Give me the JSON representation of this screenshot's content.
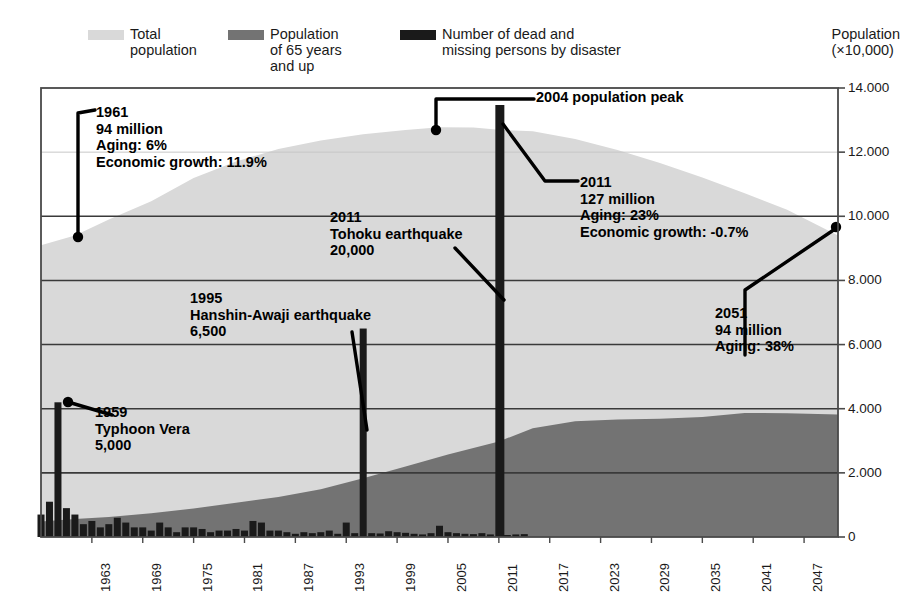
{
  "legend": {
    "items": [
      {
        "name": "total-population",
        "label": "Total\npopulation",
        "color": "#d9d9d9"
      },
      {
        "name": "elderly-population",
        "label": "Population\nof 65 years\nand up",
        "color": "#737373"
      },
      {
        "name": "disaster-deaths",
        "label": "Number of dead and\nmissing persons by disaster",
        "color": "#1a1a1a"
      }
    ]
  },
  "axis_title": "Population\n(×10,000)",
  "chart_data": {
    "type": "area",
    "title": "",
    "subtitle": "",
    "xlabel": "",
    "ylabel": "Population (×10,000)",
    "ylim": [
      0,
      14000
    ],
    "xlim": [
      1957,
      2051
    ],
    "grid": true,
    "legend_position": "top",
    "y_ticks": [
      "0",
      "2.000",
      "4.000",
      "6.000",
      "8.000",
      "10.000",
      "12.000",
      "14.000"
    ],
    "y_tick_values": [
      0,
      2000,
      4000,
      6000,
      8000,
      10000,
      12000,
      14000
    ],
    "x_ticks": [
      "1963",
      "1969",
      "1975",
      "1981",
      "1987",
      "1993",
      "1999",
      "2005",
      "2011",
      "2017",
      "2023",
      "2029",
      "2035",
      "2041",
      "2047"
    ],
    "x_tick_values": [
      1963,
      1969,
      1975,
      1981,
      1987,
      1993,
      1999,
      2005,
      2011,
      2017,
      2023,
      2029,
      2035,
      2041,
      2047
    ],
    "series": [
      {
        "name": "Total population",
        "type": "area",
        "color": "#d9d9d9",
        "x": [
          1957,
          1961,
          1965,
          1970,
          1975,
          1980,
          1985,
          1990,
          1995,
          2000,
          2004,
          2008,
          2011,
          2015,
          2020,
          2025,
          2030,
          2035,
          2040,
          2045,
          2051
        ],
        "values": [
          9100,
          9400,
          9900,
          10470,
          11190,
          11710,
          12100,
          12360,
          12560,
          12690,
          12780,
          12770,
          12700,
          12650,
          12410,
          12070,
          11660,
          11210,
          10720,
          10200,
          9400
        ]
      },
      {
        "name": "Population of 65 years and up",
        "type": "area",
        "color": "#737373",
        "x": [
          1957,
          1961,
          1965,
          1970,
          1975,
          1980,
          1985,
          1990,
          1995,
          2000,
          2005,
          2011,
          2015,
          2020,
          2025,
          2030,
          2035,
          2040,
          2045,
          2051
        ],
        "values": [
          480,
          560,
          620,
          740,
          890,
          1070,
          1250,
          1490,
          1830,
          2200,
          2570,
          2980,
          3390,
          3610,
          3660,
          3690,
          3740,
          3870,
          3860,
          3820
        ]
      },
      {
        "name": "Number of dead and missing persons by disaster",
        "type": "bar",
        "color": "#1a1a1a",
        "x": [
          1957,
          1958,
          1959,
          1960,
          1961,
          1962,
          1963,
          1964,
          1965,
          1966,
          1967,
          1968,
          1969,
          1970,
          1971,
          1972,
          1973,
          1974,
          1975,
          1976,
          1977,
          1978,
          1979,
          1980,
          1981,
          1982,
          1983,
          1984,
          1985,
          1986,
          1987,
          1988,
          1989,
          1990,
          1991,
          1992,
          1993,
          1994,
          1995,
          1996,
          1997,
          1998,
          1999,
          2000,
          2001,
          2002,
          2003,
          2004,
          2005,
          2006,
          2007,
          2008,
          2009,
          2010,
          2011,
          2012,
          2013,
          2014
        ],
        "values": [
          700,
          1100,
          4200,
          900,
          700,
          400,
          500,
          300,
          400,
          600,
          450,
          300,
          300,
          200,
          450,
          300,
          150,
          300,
          300,
          250,
          150,
          200,
          200,
          250,
          200,
          500,
          450,
          200,
          200,
          150,
          100,
          150,
          120,
          150,
          200,
          100,
          450,
          120,
          6500,
          120,
          110,
          180,
          150,
          130,
          100,
          80,
          120,
          350,
          150,
          120,
          100,
          90,
          120,
          80,
          20000,
          60,
          80,
          90
        ]
      }
    ],
    "annotations": [
      {
        "name": "annotation-1961",
        "year": 1961,
        "value": 9400,
        "text": "1961\n94 million\nAging: 6%\nEconomic growth: 11.9%"
      },
      {
        "name": "annotation-2004",
        "year": 2004,
        "value": 12780,
        "text": "2004  population peak"
      },
      {
        "name": "annotation-2011",
        "year": 2011,
        "value": 12700,
        "text": "2011\n127 million\nAging: 23%\nEconomic growth: -0.7%"
      },
      {
        "name": "annotation-tohoku",
        "year": 2011,
        "value": 20000,
        "text": "2011\nTohoku earthquake\n20,000"
      },
      {
        "name": "annotation-hanshin",
        "year": 1995,
        "value": 6500,
        "text": "1995\nHanshin-Awaji earthquake\n6,500"
      },
      {
        "name": "annotation-vera",
        "year": 1959,
        "value": 5000,
        "text": "1959\nTyphoon Vera\n5,000"
      },
      {
        "name": "annotation-2051",
        "year": 2051,
        "value": 9400,
        "text": "2051\n94 million\nAging: 38%"
      }
    ]
  }
}
